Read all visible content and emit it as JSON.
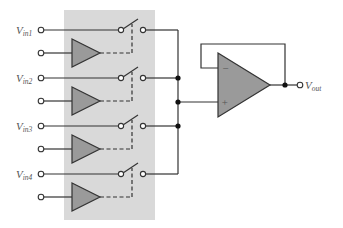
{
  "diagram": {
    "type": "analog multiplexer circuit",
    "colors": {
      "shaded_block": "#d9d9d9",
      "buffer_fill": "#9a9a9a",
      "wire": "#333333",
      "label": "#555555"
    },
    "inputs": [
      {
        "main": "V",
        "sub": "in1"
      },
      {
        "main": "V",
        "sub": "in2"
      },
      {
        "main": "V",
        "sub": "in3"
      },
      {
        "main": "V",
        "sub": "in4"
      }
    ],
    "output": {
      "main": "V",
      "sub": "out"
    },
    "opamp": {
      "minus": "−",
      "plus": "+"
    }
  }
}
